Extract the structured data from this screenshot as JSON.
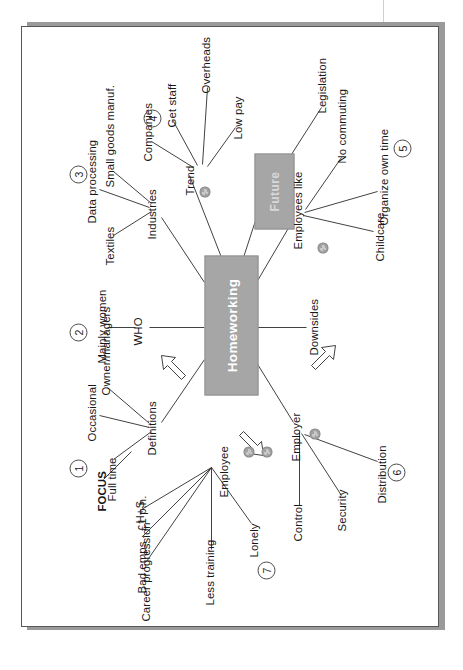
{
  "document": {
    "type": "handwritten-style mind map",
    "orientation": "landscape page displayed rotated 90 degrees"
  },
  "center": {
    "main_node": "Homeworking",
    "sub_node": "Future"
  },
  "branches": [
    {
      "number": "1",
      "head": "Definitions",
      "children": [
        "Full time",
        "Occasional",
        "Owner/managers"
      ],
      "extra_label": "FOCUS"
    },
    {
      "number": "2",
      "head": "WHO",
      "children": [
        "Mainly women"
      ]
    },
    {
      "number": "3",
      "head": "Industries",
      "children": [
        "Textiles",
        "Data processing",
        "Small goods manuf."
      ]
    },
    {
      "number": "4",
      "head": "Trend",
      "children": [
        "Companies",
        "Get staff",
        "Overheads",
        "Low pay"
      ]
    },
    {
      "number": "5",
      "head": "Employees like",
      "children": [
        "Childcare",
        "Organize own time",
        "No commuting"
      ]
    },
    {
      "number": "6",
      "head": "Employer",
      "children": [
        "Control",
        "Security",
        "Distribution"
      ]
    },
    {
      "number": "7",
      "head": "Employee",
      "children": [
        "Career progression",
        "Bad emps - £1 p.h.",
        "H+S",
        "Less training",
        "Lonely"
      ]
    }
  ],
  "loose_labels": {
    "downsides": "Downsides",
    "legislation": "Legislation",
    "focus": "FOCUS"
  },
  "nodes": {
    "definitions": "Definitions",
    "who": "WHO",
    "industries": "Industries",
    "trend": "Trend",
    "employees_like": "Employees like",
    "employer": "Employer",
    "employee": "Employee"
  },
  "leaves": {
    "full_time": "Full time",
    "occasional": "Occasional",
    "owner_managers": "Owner/managers",
    "mainly_women": "Mainly women",
    "textiles": "Textiles",
    "data_processing": "Data processing",
    "small_goods": "Small goods manuf.",
    "companies": "Companies",
    "get_staff": "Get staff",
    "overheads": "Overheads",
    "low_pay": "Low pay",
    "childcare": "Childcare",
    "organize_own_time": "Organize own time",
    "no_commuting": "No commuting",
    "control": "Control",
    "security": "Security",
    "distribution": "Distribution",
    "career_progression": "Career progression",
    "bad_emps": "Bad emps - £1 p.h.",
    "hs": "H+S",
    "less_training": "Less training",
    "lonely": "Lonely"
  },
  "numbers": {
    "n1": "1",
    "n2": "2",
    "n3": "3",
    "n4": "4",
    "n5": "5",
    "n6": "6",
    "n7": "7"
  },
  "colors": {
    "node_fill": "#a6a6a6",
    "node_text": "#ffffff",
    "line": "#2b2b2b",
    "arrow_fill": "#c6c6c6",
    "paper": "#ffffff",
    "paper_border": "#575757",
    "shadow": "#9a9a9a"
  }
}
